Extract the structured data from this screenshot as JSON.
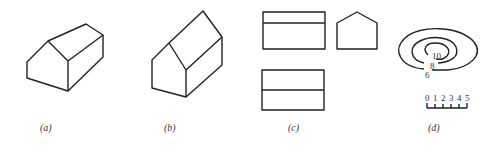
{
  "figure": {
    "panels": [
      {
        "id": "a",
        "caption": "(a)",
        "description": "isometric house, low roof"
      },
      {
        "id": "b",
        "caption": "(b)",
        "description": "isometric house, tall roof"
      },
      {
        "id": "c",
        "caption": "(c)",
        "description": "orthographic views: top, side, front"
      },
      {
        "id": "d",
        "caption": "(d)",
        "description": "contour map with scale"
      }
    ],
    "contours": {
      "labels": [
        "10",
        "8",
        "6"
      ]
    },
    "scale": {
      "ticks": [
        "0",
        "1",
        "2",
        "3",
        "4",
        "5"
      ]
    }
  }
}
